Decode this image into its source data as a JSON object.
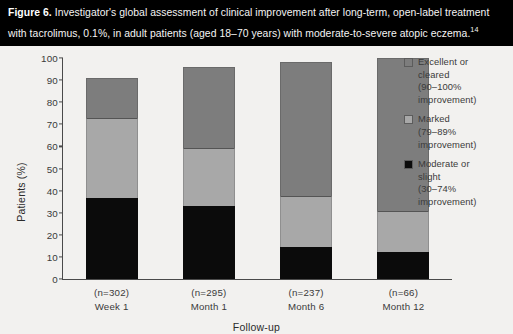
{
  "caption": {
    "figure_number": "Figure 6.",
    "text": " Investigator's global assessment of clinical improvement after long-term, open-label treatment with tacrolimus, 0.1%, in adult patients (aged 18–70 years) with moderate-to-severe atopic eczema.",
    "reference": "14"
  },
  "chart_data": {
    "type": "bar",
    "subtype": "stacked-bar",
    "title": "",
    "xlabel": "Follow-up",
    "ylabel": "Patients (%)",
    "ylim": [
      0,
      100
    ],
    "yticks": [
      0,
      10,
      20,
      30,
      40,
      50,
      60,
      70,
      80,
      90,
      100
    ],
    "grid": false,
    "legend_position": "right",
    "categories": [
      "Week 1",
      "Month 1",
      "Month 6",
      "Month 12"
    ],
    "group_sizes": [
      "(n=302)",
      "(n=295)",
      "(n=237)",
      "(n=66)"
    ],
    "series": [
      {
        "name": "Moderate or slight (30–74% improvement)",
        "short_name": "Moderate or slight",
        "range_label": "(30–74%",
        "improvement_label": "improvement)",
        "color": "#0b0b0b",
        "values": [
          36.5,
          33,
          14.5,
          12
        ]
      },
      {
        "name": "Marked (79–89% improvement)",
        "short_name": "Marked",
        "range_label": "(79–89%",
        "improvement_label": "improvement)",
        "color": "#a8a8a8",
        "values": [
          36.5,
          26.5,
          23,
          19
        ]
      },
      {
        "name": "Excellent or cleared (90–100% improvement)",
        "short_name_line1": "Excellent or",
        "short_name_line2": "cleared",
        "range_label": "(90–100%",
        "improvement_label": "improvement)",
        "color": "#7d7d7d",
        "values": [
          18,
          36.5,
          60.5,
          69
        ]
      }
    ],
    "totals": [
      91,
      96,
      98,
      100
    ]
  },
  "legend": [
    {
      "swatch_color": "#7d7d7d",
      "line1": "Excellent or",
      "line2": "cleared",
      "line3": "(90–100%",
      "line4": "improvement)"
    },
    {
      "swatch_color": "#a8a8a8",
      "line1": "Marked",
      "line2": "(79–89%",
      "line3": "improvement)"
    },
    {
      "swatch_color": "#0b0b0b",
      "line1": "Moderate or",
      "line2": "slight",
      "line3": "(30–74%",
      "line4": "improvement)"
    }
  ]
}
